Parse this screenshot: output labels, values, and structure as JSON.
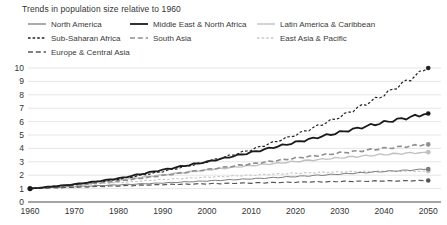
{
  "title": "Trends in population size relative to 1960",
  "chart_data": {
    "type": "line",
    "title": "Trends in population size relative to 1960",
    "xlabel": "",
    "ylabel": "",
    "x": [
      1960,
      1970,
      1980,
      1990,
      2000,
      2010,
      2020,
      2030,
      2040,
      2050
    ],
    "xticks": [
      "1960",
      "1970",
      "1980",
      "1990",
      "2000",
      "2010",
      "2020",
      "2030",
      "2040",
      "2050"
    ],
    "yticks": [
      "0",
      "1",
      "2",
      "3",
      "4",
      "5",
      "6",
      "7",
      "8",
      "9",
      "10"
    ],
    "ylim": [
      0,
      10
    ],
    "xlim": [
      1960,
      2050
    ],
    "grid": "horizontal-only",
    "legend_position": "top",
    "start_marker": {
      "year": 1960,
      "value": 1.0,
      "color": "#1a1a1a"
    },
    "end_markers_at": 2050,
    "series": [
      {
        "name": "North America",
        "color": "#7d7d7d",
        "style": "solid",
        "width": 1.0,
        "values": [
          1.0,
          1.15,
          1.28,
          1.42,
          1.57,
          1.73,
          1.9,
          2.08,
          2.28,
          2.45
        ]
      },
      {
        "name": "Middle East & North Africa",
        "color": "#1a1a1a",
        "style": "solid",
        "width": 1.8,
        "values": [
          1.0,
          1.32,
          1.76,
          2.4,
          3.0,
          3.7,
          4.45,
          5.2,
          5.95,
          6.6
        ]
      },
      {
        "name": "Latin America & Caribbean",
        "color": "#c0c0c0",
        "style": "solid",
        "width": 1.4,
        "values": [
          1.0,
          1.3,
          1.65,
          2.02,
          2.4,
          2.72,
          3.02,
          3.3,
          3.55,
          3.72
        ]
      },
      {
        "name": "Sub-Saharan Africa",
        "color": "#222222",
        "style": "dash-short",
        "width": 1.2,
        "values": [
          1.0,
          1.3,
          1.7,
          2.28,
          3.0,
          3.9,
          5.0,
          6.35,
          8.0,
          10.0
        ]
      },
      {
        "name": "South Asia",
        "color": "#8f8f8f",
        "style": "dash-med",
        "width": 1.6,
        "values": [
          1.0,
          1.25,
          1.56,
          1.98,
          2.42,
          2.85,
          3.27,
          3.66,
          4.0,
          4.3
        ]
      },
      {
        "name": "East Asia & Pacific",
        "color": "#c9c9c9",
        "style": "dash-short",
        "width": 1.2,
        "values": [
          1.0,
          1.25,
          1.45,
          1.68,
          1.85,
          2.0,
          2.15,
          2.25,
          2.3,
          2.3
        ]
      },
      {
        "name": "Europe & Central Asia",
        "color": "#585858",
        "style": "dash-med",
        "width": 1.2,
        "values": [
          1.0,
          1.1,
          1.2,
          1.3,
          1.36,
          1.42,
          1.48,
          1.53,
          1.57,
          1.6
        ]
      }
    ],
    "legend_rows": [
      [
        0,
        1,
        2
      ],
      [
        3,
        4,
        5
      ],
      [
        6
      ]
    ]
  }
}
